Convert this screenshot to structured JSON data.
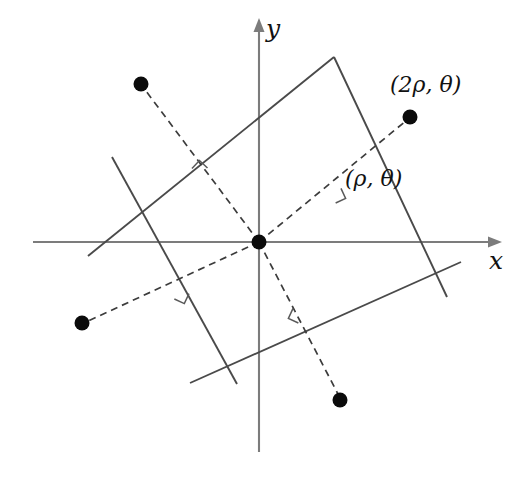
{
  "figure": {
    "background_color": "#ffffff",
    "width": 526,
    "height": 480
  },
  "axes": {
    "origin": {
      "x": 259,
      "y": 242
    },
    "x_axis": {
      "label": "x",
      "from": {
        "x": 33,
        "y": 242
      },
      "to": {
        "x": 502,
        "y": 242
      },
      "arrow": "right",
      "color": "#7c7c7c"
    },
    "y_axis": {
      "label": "y",
      "from": {
        "x": 259,
        "y": 452
      },
      "to": {
        "x": 259,
        "y": 18
      },
      "arrow": "up",
      "color": "#7c7c7c"
    }
  },
  "labels": [
    {
      "id": "label-p2",
      "text": "(2ρ, θ)"
    },
    {
      "id": "label-p1",
      "text": "(ρ, θ)"
    },
    {
      "id": "label-y",
      "text": "y"
    },
    {
      "id": "label-x",
      "text": "x"
    }
  ],
  "points": [
    {
      "name": "point-upper-left",
      "x": 141,
      "y": 84,
      "radius": 7.5
    },
    {
      "name": "point-upper-right",
      "x": 410,
      "y": 117,
      "radius": 7.5
    },
    {
      "name": "point-lower-left",
      "x": 82,
      "y": 323,
      "radius": 7.5
    },
    {
      "name": "point-lower-right",
      "x": 340,
      "y": 400,
      "radius": 7.5
    },
    {
      "name": "point-origin",
      "x": 259,
      "y": 242,
      "radius": 7.5
    }
  ],
  "dashed_rays": [
    {
      "name": "ray-to-upper-left",
      "x1": 259,
      "y1": 242,
      "x2": 141,
      "y2": 84
    },
    {
      "name": "ray-to-upper-right",
      "x1": 259,
      "y1": 242,
      "x2": 410,
      "y2": 117
    },
    {
      "name": "ray-to-lower-left",
      "x1": 259,
      "y1": 242,
      "x2": 82,
      "y2": 323
    },
    {
      "name": "ray-to-lower-right",
      "x1": 259,
      "y1": 242,
      "x2": 340,
      "y2": 400
    }
  ],
  "solid_lines": [
    {
      "name": "line-upper-left-near",
      "x1": 112,
      "y1": 157,
      "x2": 237,
      "y2": 384
    },
    {
      "name": "line-upper-left-far",
      "x1": 88,
      "y1": 255,
      "x2": 334,
      "y2": 57
    },
    {
      "name": "line-upper-right-near",
      "x1": 334,
      "y1": 57,
      "x2": 447,
      "y2": 297
    },
    {
      "name": "line-upper-right-far",
      "x1": 190,
      "y1": 383,
      "x2": 461,
      "y2": 262
    },
    {
      "name": "line-lower-left",
      "x1": 38,
      "y1": 245,
      "x2": 213,
      "y2": 243
    }
  ],
  "right_angle_markers": [
    {
      "name": "right-angle-upper-left",
      "x": 200,
      "y": 176,
      "rotation": 35
    },
    {
      "name": "right-angle-upper-right",
      "x": 331,
      "y": 193,
      "rotation": -25
    },
    {
      "name": "right-angle-lower-left",
      "x": 180,
      "y": 288,
      "rotation": 115
    },
    {
      "name": "right-angle-lower-right",
      "x": 304,
      "y": 313,
      "rotation": 64
    }
  ],
  "colors": {
    "axis": "#7c7c7c",
    "solid_line": "#4a4a4a",
    "dashed_line": "#3c3c3c",
    "dot": "#0b0b0b",
    "right_angle": "#5a5a5a"
  }
}
